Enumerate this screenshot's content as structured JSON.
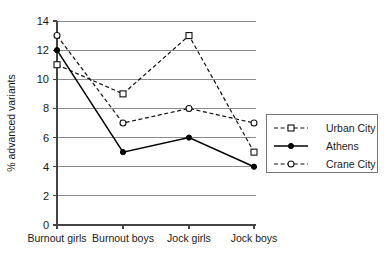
{
  "chart_data": {
    "type": "line",
    "title": "",
    "xlabel": "",
    "ylabel": "% advanced variants",
    "categories": [
      "Burnout girls",
      "Burnout boys",
      "Jock girls",
      "Jock boys"
    ],
    "series": [
      {
        "name": "Urban City",
        "values": [
          11,
          9,
          13,
          5
        ],
        "style": "dashed",
        "marker": "open-square"
      },
      {
        "name": "Athens",
        "values": [
          12,
          5,
          6,
          4
        ],
        "style": "solid",
        "marker": "filled-circle"
      },
      {
        "name": "Crane City",
        "values": [
          13,
          7,
          8,
          7
        ],
        "style": "dashed",
        "marker": "open-circle"
      }
    ],
    "ylim": [
      0,
      14
    ],
    "yticks": [
      0,
      2,
      4,
      6,
      8,
      10,
      12,
      14
    ],
    "ytick_labels": [
      "0",
      "2",
      "4",
      "6",
      "8",
      "10",
      "12",
      "14"
    ],
    "grid": "horizontal",
    "legend_position": "right",
    "colors": {
      "line": "#111111",
      "grid": "#8c8c8c",
      "axis": "#444444",
      "background": "#ffffff"
    }
  },
  "legend": {
    "entries": [
      {
        "label": "Urban City"
      },
      {
        "label": "Athens"
      },
      {
        "label": "Crane City"
      }
    ]
  }
}
